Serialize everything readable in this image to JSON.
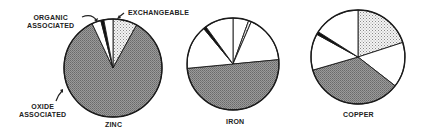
{
  "chart_data": [
    {
      "type": "pie",
      "title": "ZINC",
      "start_angle_deg": 0,
      "direction": "clockwise",
      "slices": [
        {
          "name": "Exchangeable",
          "value": 8,
          "pattern": "dotted"
        },
        {
          "name": "Oxide associated",
          "value": 85,
          "pattern": "dark"
        },
        {
          "name": "Residual",
          "value": 3,
          "pattern": "white"
        },
        {
          "name": "Organic associated",
          "value": 1,
          "pattern": "black"
        },
        {
          "name": "Residual (2)",
          "value": 3,
          "pattern": "white"
        }
      ]
    },
    {
      "type": "pie",
      "title": "IRON",
      "start_angle_deg": 0,
      "direction": "clockwise",
      "slices": [
        {
          "name": "Residual",
          "value": 5.5,
          "pattern": "white"
        },
        {
          "name": "Exchangeable",
          "value": 1,
          "pattern": "dotted"
        },
        {
          "name": "Residual (2)",
          "value": 17,
          "pattern": "white"
        },
        {
          "name": "Oxide associated",
          "value": 50,
          "pattern": "dark"
        },
        {
          "name": "Residual (3)",
          "value": 15.5,
          "pattern": "white"
        },
        {
          "name": "Organic associated",
          "value": 1,
          "pattern": "black"
        },
        {
          "name": "Residual (4)",
          "value": 10,
          "pattern": "white"
        }
      ]
    },
    {
      "type": "pie",
      "title": "COPPER",
      "start_angle_deg": 0,
      "direction": "clockwise",
      "slices": [
        {
          "name": "Exchangeable",
          "value": 20,
          "pattern": "dotted"
        },
        {
          "name": "Residual",
          "value": 15.5,
          "pattern": "white"
        },
        {
          "name": "Oxide associated",
          "value": 35,
          "pattern": "dark"
        },
        {
          "name": "Residual (2)",
          "value": 12.5,
          "pattern": "white"
        },
        {
          "name": "Organic associated",
          "value": 1,
          "pattern": "black"
        },
        {
          "name": "Residual (3)",
          "value": 16,
          "pattern": "white"
        }
      ]
    }
  ],
  "labels": {
    "organic_line1": "ORGANIC",
    "organic_line2": "ASSOCIATED",
    "exchangeable": "EXCHANGEABLE",
    "oxide_line1": "OXIDE",
    "oxide_line2": "ASSOCIATED",
    "zinc": "ZINC",
    "iron": "IRON",
    "copper": "COPPER"
  },
  "colors": {
    "outline": "#1a1a1a",
    "dark_fill": "#8a8a8a",
    "dotted_bg": "#f2f2f2",
    "dotted_dot": "#777777",
    "black": "#111111",
    "white": "#ffffff"
  }
}
